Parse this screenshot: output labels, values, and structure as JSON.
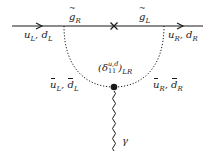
{
  "diagram": {
    "type": "feynman",
    "colors": {
      "line": "#1a1a1a",
      "background": "#ffffff"
    },
    "labels": {
      "incoming_quark": "u_L, d_L",
      "outgoing_quark": "u_R, d_R",
      "gluino_left": "g̃_R",
      "gluino_right": "g̃_L",
      "squark_left": "ū̃_L, d̄̃_L",
      "squark_right": "ū̃_R, d̄̃_R",
      "insertion": "(δ^{u,d}_{11})_{LR}",
      "photon": "γ"
    },
    "label_parts": {
      "u": "u",
      "d": "d",
      "g": "g",
      "L": "L",
      "R": "R",
      "LR": "LR",
      "comma": ",",
      "delta": "δ",
      "ud": "u,d",
      "eleven": "11",
      "lparen": "(",
      "rparen": ")",
      "gamma": "γ"
    },
    "elements": {
      "fermion_line": {
        "from": [
          12,
          26
        ],
        "to": [
          203,
          26
        ],
        "arrows": [
          [
            40,
            26
          ],
          [
            180,
            26
          ]
        ]
      },
      "mass_insertion_cross": [
        114,
        26
      ],
      "scalar_loop": {
        "from": [
          64,
          26
        ],
        "to": [
          164,
          26
        ],
        "bottom": [
          114,
          87
        ],
        "style": "dotted"
      },
      "vertex_dot": [
        114,
        87
      ],
      "photon_line": {
        "from": [
          114,
          90
        ],
        "to": [
          114,
          150
        ],
        "style": "wavy"
      }
    }
  }
}
